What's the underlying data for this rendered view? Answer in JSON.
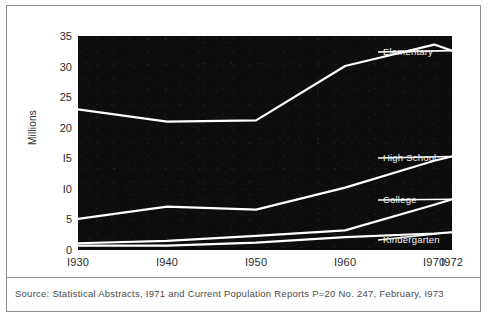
{
  "source_note": "Source: Statistical Abstracts, I971 and Current Population Reports P=20 No. 247, February, I973",
  "chart_data": {
    "type": "line",
    "title": "",
    "xlabel": "",
    "ylabel": "Millions",
    "x": [
      1930,
      1940,
      1950,
      1960,
      1970,
      1972
    ],
    "xtick_labels": [
      "I930",
      "I940",
      "I950",
      "I960",
      "I970",
      "I972"
    ],
    "ytick_labels": [
      "0",
      "5",
      "I0",
      "I5",
      "20",
      "25",
      "30",
      "35"
    ],
    "ytick_values": [
      0,
      5,
      10,
      15,
      20,
      25,
      30,
      35
    ],
    "ylim": [
      0,
      35
    ],
    "xlim": [
      1930,
      1972
    ],
    "grid": false,
    "legend_position": "right-inline",
    "plot_background": "#0d0d0d",
    "line_color": "#ffffff",
    "series": [
      {
        "name": "Elementary",
        "label": "Elementary",
        "values": [
          23.0,
          21.0,
          21.2,
          30.1,
          33.6,
          32.6
        ]
      },
      {
        "name": "High School",
        "label": "High School",
        "values": [
          5.1,
          7.1,
          6.6,
          10.2,
          14.6,
          15.3
        ]
      },
      {
        "name": "College",
        "label": "College",
        "values": [
          1.1,
          1.5,
          2.3,
          3.2,
          7.4,
          8.3
        ]
      },
      {
        "name": "Kindergarten",
        "label": "Kindergarten",
        "values": [
          0.7,
          0.7,
          1.2,
          2.1,
          2.7,
          2.9
        ]
      }
    ]
  }
}
